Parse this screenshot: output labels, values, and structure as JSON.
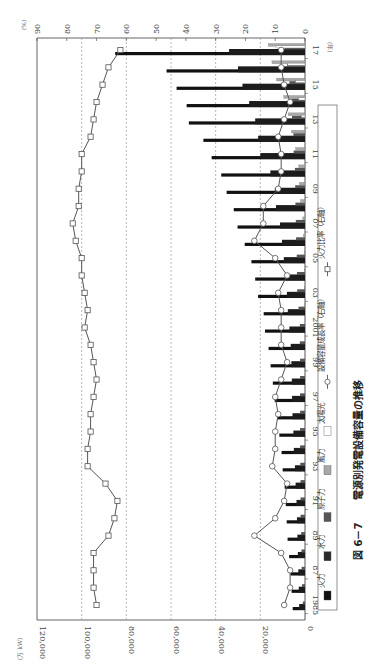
{
  "figure": {
    "caption_number": "図 6－7",
    "caption_title": "電源別発電設備容量の推移"
  },
  "axes": {
    "left_unit": "(万 kW)",
    "right_unit": "(%)",
    "year_unit": "(年)",
    "capacity_ticks": [
      "0",
      "20,000",
      "40,000",
      "60,000",
      "80,000",
      "100,000",
      "120,000"
    ],
    "percent_ticks": [
      "0",
      "10",
      "20",
      "30",
      "40",
      "50",
      "60",
      "70",
      "80",
      "90"
    ],
    "year_tick_labels": [
      "1985",
      "87",
      "89",
      "91",
      "93",
      "95",
      "97",
      "99",
      "2001",
      "03",
      "05",
      "07",
      "09",
      "11",
      "13",
      "15",
      "17"
    ]
  },
  "legend": {
    "items": [
      {
        "key": "thermal",
        "label": "火力",
        "swatch": "#111111",
        "type": "bar"
      },
      {
        "key": "hydro",
        "label": "水力",
        "swatch": "#2a2a2a",
        "type": "bar"
      },
      {
        "key": "nuclear",
        "label": "原子力",
        "swatch": "#555555",
        "type": "bar"
      },
      {
        "key": "wind",
        "label": "風力",
        "swatch": "#a8a8a8",
        "type": "bar"
      },
      {
        "key": "solar",
        "label": "太陽光",
        "swatch": "#ffffff",
        "type": "bar"
      },
      {
        "key": "growth",
        "label": "設備容量成長率（右軸）",
        "marker": "circle",
        "type": "line"
      },
      {
        "key": "thermal_share",
        "label": "火力比率（右軸）",
        "marker": "square",
        "type": "line"
      }
    ]
  },
  "chart_data": {
    "type": "bar",
    "title": "図 6－7 電源別発電設備容量の推移",
    "orientation": "rotated-90-clockwise",
    "xlabel": "(年)",
    "ylabel": "(万 kW)",
    "y2label": "(%)",
    "ylim": [
      0,
      120000
    ],
    "y2lim": [
      0,
      90
    ],
    "grid": "dashed vertical (rotated horizontal) at every 20,000 / 10%",
    "legend_position": "bottom (rotated right side), boxed",
    "categories": [
      1985,
      1986,
      1987,
      1988,
      1989,
      1990,
      1991,
      1992,
      1993,
      1994,
      1995,
      1996,
      1997,
      1998,
      1999,
      2000,
      2001,
      2002,
      2003,
      2004,
      2005,
      2006,
      2007,
      2008,
      2009,
      2010,
      2011,
      2012,
      2013,
      2014,
      2015,
      2016,
      2017
    ],
    "series": [
      {
        "name": "火力",
        "axis": "left",
        "values": [
          5500,
          6000,
          6500,
          7100,
          7800,
          8200,
          8600,
          9100,
          10000,
          10500,
          11500,
          12500,
          13600,
          14400,
          15400,
          16300,
          17900,
          18500,
          21000,
          22300,
          24000,
          27000,
          30200,
          31900,
          35100,
          37500,
          41800,
          45500,
          52000,
          53000,
          57500,
          62000,
          85000
        ]
      },
      {
        "name": "水力",
        "axis": "left",
        "values": [
          2600,
          2800,
          3000,
          3200,
          3400,
          3600,
          3800,
          4200,
          4500,
          5000,
          5200,
          5600,
          5800,
          5900,
          6100,
          6400,
          7000,
          7700,
          8100,
          8500,
          9500,
          10300,
          11200,
          13000,
          13500,
          15500,
          20000,
          21000,
          22300,
          25000,
          28000,
          30000,
          34000
        ]
      },
      {
        "name": "原子力",
        "axis": "left",
        "values": [
          1000,
          1300,
          1500,
          1600,
          1700,
          2000,
          2000,
          2000,
          2100,
          2200,
          2200,
          2200,
          2200,
          2200,
          2200,
          2300,
          2300,
          2900,
          3500,
          3600,
          3700,
          4000,
          4100,
          4300,
          4400,
          4500,
          5100,
          5200,
          5800,
          6200,
          7000,
          8000,
          9200
        ]
      },
      {
        "name": "風力",
        "axis": "left",
        "values": [
          0,
          0,
          0,
          0,
          0,
          0,
          0,
          0,
          0,
          0,
          0,
          0,
          0,
          0,
          0,
          0,
          0,
          50,
          100,
          200,
          400,
          700,
          1000,
          2000,
          2500,
          2800,
          4200,
          6000,
          7500,
          9500,
          12700,
          14800,
          16400
        ]
      },
      {
        "name": "太陽光",
        "axis": "left",
        "values": [
          0,
          0,
          0,
          0,
          0,
          0,
          0,
          0,
          0,
          0,
          0,
          0,
          0,
          0,
          0,
          0,
          0,
          0,
          0,
          0,
          0,
          0,
          0,
          0,
          0,
          0,
          0,
          0,
          1600,
          2800,
          4200,
          7700,
          13000
        ]
      },
      {
        "name": "設備容量成長率（右軸）",
        "axis": "right",
        "type": "line",
        "values": [
          7,
          5,
          5,
          8,
          17,
          10,
          7,
          6,
          11,
          10,
          10,
          9,
          10,
          8,
          6,
          8,
          8,
          8,
          9,
          6,
          10,
          17,
          14,
          14,
          9,
          8,
          8,
          9,
          7,
          5,
          7,
          8,
          8
        ]
      },
      {
        "name": "火力比率（右軸）",
        "axis": "right",
        "type": "line",
        "values": [
          70,
          71,
          71,
          71,
          66,
          64,
          63,
          67,
          73,
          73,
          72,
          72,
          71,
          70,
          71,
          72,
          74,
          73,
          74,
          75,
          75,
          77,
          78,
          76,
          76,
          75,
          75,
          72,
          71,
          70,
          68,
          66,
          62
        ]
      }
    ]
  }
}
